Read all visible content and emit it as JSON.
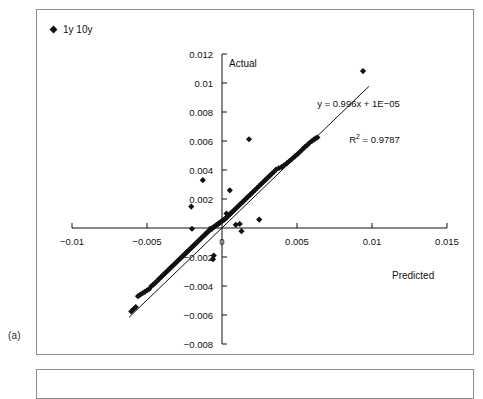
{
  "figure": {
    "caption": "(a)",
    "panel_a_name": "scatter-panel",
    "panel_b_name": "second-panel"
  },
  "chart_data": {
    "type": "scatter",
    "title": "",
    "xlabel": "Predicted",
    "ylabel": "Actual",
    "xlim": [
      -0.0125,
      0.0165
    ],
    "ylim": [
      -0.0088,
      0.0128
    ],
    "xticks": [
      -0.01,
      -0.005,
      0,
      0.005,
      0.01,
      0.015
    ],
    "xtick_labels": [
      "−0.01",
      "−0.005",
      "0",
      "0.005",
      "0.01",
      "0.015"
    ],
    "yticks": [
      0.012,
      0.01,
      0.008,
      0.006,
      0.004,
      0.002,
      0,
      -0.002,
      -0.004,
      -0.006,
      -0.008
    ],
    "ytick_labels": [
      "0.012",
      "0.01",
      "0.008",
      "0.006",
      "0.004",
      "0.002",
      "0",
      "−0.002",
      "−0.004",
      "−0.006",
      "−0.008"
    ],
    "grid": false,
    "axes_style": "zero-crossing",
    "legend": {
      "position": "top-left",
      "entries": [
        {
          "label": "1y 10y",
          "marker": "diamond",
          "color": "#111111"
        }
      ]
    },
    "annotations": [
      {
        "name": "regression-equation",
        "line1": "y = 0.996x + 1E−05",
        "line2_prefix": "R",
        "line2_sup": "2",
        "line2_suffix": " = 0.9787"
      }
    ],
    "trendline": {
      "slope": 0.996,
      "intercept": 1e-05,
      "r_squared": 0.9787,
      "x_start": -0.0062,
      "x_end": 0.0098,
      "color": "#111111"
    },
    "series": [
      {
        "name": "1y 10y",
        "marker": "diamond",
        "color": "#111111",
        "points": [
          [
            -0.00605,
            -0.00575
          ],
          [
            -0.0059,
            -0.0056
          ],
          [
            -0.00575,
            -0.00545
          ],
          [
            -0.0056,
            -0.0047
          ],
          [
            -0.00545,
            -0.0046
          ],
          [
            -0.0053,
            -0.0045
          ],
          [
            -0.00515,
            -0.0044
          ],
          [
            -0.005,
            -0.0043
          ],
          [
            -0.00485,
            -0.0042
          ],
          [
            -0.0047,
            -0.004
          ],
          [
            -0.00458,
            -0.0039
          ],
          [
            -0.00445,
            -0.00378
          ],
          [
            -0.00432,
            -0.00365
          ],
          [
            -0.0042,
            -0.00352
          ],
          [
            -0.00408,
            -0.0034
          ],
          [
            -0.00396,
            -0.00328
          ],
          [
            -0.00384,
            -0.00316
          ],
          [
            -0.00372,
            -0.00304
          ],
          [
            -0.0036,
            -0.00292
          ],
          [
            -0.00348,
            -0.0028
          ],
          [
            -0.00336,
            -0.00268
          ],
          [
            -0.00324,
            -0.00256
          ],
          [
            -0.00312,
            -0.00244
          ],
          [
            -0.003,
            -0.00232
          ],
          [
            -0.0029,
            -0.00222
          ],
          [
            -0.0028,
            -0.00212
          ],
          [
            -0.0027,
            -0.00202
          ],
          [
            -0.0026,
            -0.00192
          ],
          [
            -0.0025,
            -0.00182
          ],
          [
            -0.0024,
            -0.00172
          ],
          [
            -0.0023,
            -0.00162
          ],
          [
            -0.0022,
            -0.00152
          ],
          [
            -0.0021,
            -0.00142
          ],
          [
            -0.002,
            -0.00132
          ],
          [
            -0.0019,
            -0.00122
          ],
          [
            -0.0018,
            -0.00112
          ],
          [
            -0.0017,
            -0.00102
          ],
          [
            -0.0016,
            -0.00092
          ],
          [
            -0.0015,
            -0.00082
          ],
          [
            -0.0014,
            -0.00072
          ],
          [
            -0.0013,
            -0.00062
          ],
          [
            -0.00122,
            -0.00054
          ],
          [
            -0.00114,
            -0.00046
          ],
          [
            -0.00106,
            -0.00038
          ],
          [
            -0.00098,
            -0.0003
          ],
          [
            -0.0009,
            -0.00022
          ],
          [
            -0.00082,
            -0.00014
          ],
          [
            -0.00074,
            -8e-05
          ],
          [
            -0.00066,
            -2e-05
          ],
          [
            -0.00058,
            4e-05
          ],
          [
            -0.0005,
            0.0001
          ],
          [
            -0.00042,
            0.00016
          ],
          [
            -0.00034,
            0.00022
          ],
          [
            -0.00026,
            0.00028
          ],
          [
            -0.00018,
            0.00034
          ],
          [
            -0.0001,
            0.0004
          ],
          [
            -2e-05,
            0.00046
          ],
          [
            6e-05,
            0.00052
          ],
          [
            0.00014,
            0.00058
          ],
          [
            0.00022,
            0.00064
          ],
          [
            0.0003,
            0.00072
          ],
          [
            0.0004,
            0.00082
          ],
          [
            0.0005,
            0.00092
          ],
          [
            0.0006,
            0.00102
          ],
          [
            0.0007,
            0.00112
          ],
          [
            0.0008,
            0.00122
          ],
          [
            0.0009,
            0.00132
          ],
          [
            0.001,
            0.00142
          ],
          [
            0.00112,
            0.00154
          ],
          [
            0.00124,
            0.00166
          ],
          [
            0.00136,
            0.00178
          ],
          [
            0.00148,
            0.0019
          ],
          [
            0.0016,
            0.00202
          ],
          [
            0.00172,
            0.00214
          ],
          [
            0.00184,
            0.00226
          ],
          [
            0.00196,
            0.00238
          ],
          [
            0.00208,
            0.0025
          ],
          [
            0.0022,
            0.00262
          ],
          [
            0.00234,
            0.00276
          ],
          [
            0.00248,
            0.0029
          ],
          [
            0.00262,
            0.00304
          ],
          [
            0.00276,
            0.00318
          ],
          [
            0.0029,
            0.00332
          ],
          [
            0.00304,
            0.00346
          ],
          [
            0.00318,
            0.0036
          ],
          [
            0.00332,
            0.00374
          ],
          [
            0.00346,
            0.00388
          ],
          [
            0.0036,
            0.00402
          ],
          [
            0.00378,
            0.00412
          ],
          [
            0.00396,
            0.0042
          ],
          [
            0.00414,
            0.00432
          ],
          [
            0.00432,
            0.00446
          ],
          [
            0.0045,
            0.00462
          ],
          [
            0.00468,
            0.00478
          ],
          [
            0.00486,
            0.00494
          ],
          [
            0.00504,
            0.0051
          ],
          [
            0.0052,
            0.00526
          ],
          [
            0.00536,
            0.00542
          ],
          [
            0.00552,
            0.00558
          ],
          [
            0.00568,
            0.00572
          ],
          [
            0.00584,
            0.00588
          ],
          [
            0.006,
            0.006
          ],
          [
            0.00612,
            0.0061
          ],
          [
            0.00624,
            0.00618
          ],
          [
            0.00636,
            0.00624
          ],
          [
            -0.00205,
            0.00148
          ],
          [
            -0.002,
            -5e-05
          ],
          [
            -0.00128,
            0.0033
          ],
          [
            -0.0006,
            -0.00215
          ],
          [
            -0.00055,
            -0.0019
          ],
          [
            0.00052,
            0.0026
          ],
          [
            0.0003,
            0.001
          ],
          [
            0.00092,
            0.00022
          ],
          [
            0.00118,
            0.00028
          ],
          [
            0.0013,
            -0.00022
          ],
          [
            0.0018,
            0.00612
          ],
          [
            0.00248,
            0.00058
          ],
          [
            0.0094,
            0.01082
          ]
        ]
      }
    ]
  }
}
